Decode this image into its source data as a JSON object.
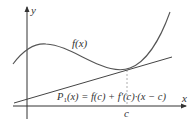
{
  "diagram": {
    "axes": {
      "x_label": "x",
      "y_label": "y"
    },
    "curve": {
      "label": "f(x)"
    },
    "tangent": {
      "label_P": "P",
      "label_sub": "1",
      "label_rest": "(x) = f(c) + f′(c)·(x − c)"
    },
    "point": {
      "label": "c"
    },
    "colors": {
      "curve": "#555555",
      "tangent": "#444444",
      "axes": "#333333",
      "dashed": "#999999"
    }
  }
}
